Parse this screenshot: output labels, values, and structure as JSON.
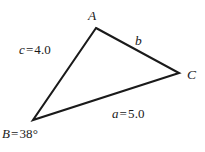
{
  "figure": {
    "type": "triangle-diagram",
    "background_color": "#ffffff",
    "stroke_color": "#1a1a1a",
    "stroke_width": 2.1,
    "vertices": {
      "A": {
        "label": "A",
        "x": 96,
        "y": 28
      },
      "B": {
        "label": "B",
        "x": 33,
        "y": 120
      },
      "C": {
        "label": "C",
        "x": 179,
        "y": 73
      }
    },
    "sides": {
      "a": {
        "label": "a = 5.0",
        "variable": "a",
        "equals": "=",
        "value": "5.0",
        "opposite_vertex": "A",
        "endpoints": "B-C"
      },
      "b": {
        "label": "b",
        "variable": "b",
        "equals": "",
        "value": "",
        "opposite_vertex": "B",
        "endpoints": "A-C"
      },
      "c": {
        "label": "c = 4.0",
        "variable": "c",
        "equals": "=",
        "value": "4.0",
        "opposite_vertex": "C",
        "endpoints": "A-B"
      }
    },
    "angles": {
      "B": {
        "label": "B = 38°",
        "variable": "B",
        "equals": "=",
        "value": "38°",
        "degrees": 38
      }
    }
  }
}
